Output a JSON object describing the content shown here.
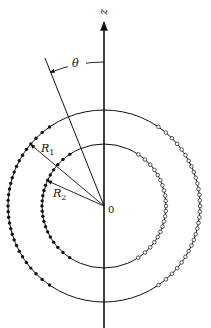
{
  "figure": {
    "type": "two concentric circles with filled and open points, polar angle theta measured from z axis",
    "center": {
      "x": 104,
      "y": 206
    },
    "axis_label": "z",
    "angle_label": "θ",
    "origin_label": "0",
    "outer_radius_label": "R",
    "outer_radius_sub": "1",
    "inner_radius_label": "R",
    "inner_radius_sub": "2",
    "outer_radius_px": 96,
    "inner_radius_px": 62,
    "tilt_deg": 22,
    "outer_points_per_half": 34,
    "inner_points_per_half": 24,
    "left_points_style": "filled",
    "right_points_style": "open",
    "colors": {
      "ink": "#111111",
      "background": "#ffffff"
    }
  }
}
